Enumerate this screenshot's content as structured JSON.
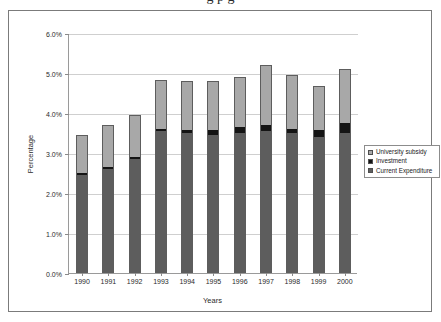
{
  "legend": {
    "position": "right-middle",
    "entries": [
      {
        "label": "University subsidy",
        "color": "#a8a8a8"
      },
      {
        "label": "Investment",
        "color": "#141414"
      },
      {
        "label": "Current Expenditure",
        "color": "#5d5d5d"
      }
    ]
  },
  "chart_data": {
    "type": "bar",
    "stacked": true,
    "title": "",
    "xlabel": "Years",
    "ylabel": "Percentage",
    "grid": true,
    "ylim": [
      0,
      6
    ],
    "ytick_labels": [
      "0.0%",
      "1.0%",
      "2.0%",
      "3.0%",
      "4.0%",
      "5.0%",
      "6.0%"
    ],
    "ytick_values": [
      0,
      1,
      2,
      3,
      4,
      5,
      6
    ],
    "categories": [
      "1990",
      "1991",
      "1992",
      "1993",
      "1994",
      "1995",
      "1996",
      "1997",
      "1998",
      "1999",
      "2000"
    ],
    "series": [
      {
        "name": "Current Expenditure",
        "color": "#5d5d5d",
        "values": [
          2.45,
          2.6,
          2.85,
          3.55,
          3.5,
          3.45,
          3.5,
          3.55,
          3.5,
          3.4,
          3.5
        ]
      },
      {
        "name": "Investment",
        "color": "#141414",
        "values": [
          0.05,
          0.05,
          0.05,
          0.07,
          0.08,
          0.13,
          0.15,
          0.15,
          0.12,
          0.18,
          0.25
        ]
      },
      {
        "name": "University subsidy",
        "color": "#a8a8a8",
        "values": [
          0.95,
          1.05,
          1.05,
          1.2,
          1.22,
          1.22,
          1.25,
          1.5,
          1.33,
          1.1,
          1.35
        ]
      }
    ],
    "totals": [
      3.45,
      3.7,
      3.95,
      4.82,
      4.8,
      4.8,
      4.9,
      5.2,
      4.95,
      4.68,
      5.1
    ]
  }
}
